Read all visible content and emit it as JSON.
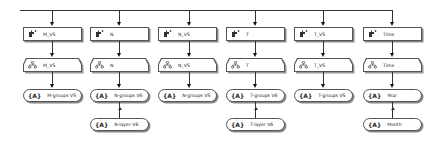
{
  "diagram": {
    "type": "dimension-hierarchy-diagram",
    "root_connector": "top-bus-line",
    "icons": {
      "dimension": "dimension-icon",
      "hierarchy": "hierarchy-icon",
      "level": "level-icon",
      "level_glyph": "{A}"
    },
    "columns": [
      {
        "dimension": "M_VS",
        "hierarchy": "M_VS",
        "levels": [
          "M-groups VS"
        ]
      },
      {
        "dimension": "N",
        "hierarchy": "N",
        "levels": [
          "N-groups V6",
          "N-layer V6"
        ]
      },
      {
        "dimension": "N_VS",
        "hierarchy": "N_VS",
        "levels": [
          "N-groups VS"
        ]
      },
      {
        "dimension": "T",
        "hierarchy": "T",
        "levels": [
          "T-groups V6",
          "T-layer V6"
        ]
      },
      {
        "dimension": "T_VS",
        "hierarchy": "T_VS",
        "levels": [
          "T-groups VS"
        ]
      },
      {
        "dimension": "Time",
        "hierarchy": "Time",
        "levels": [
          "Year",
          "Month"
        ]
      }
    ]
  }
}
